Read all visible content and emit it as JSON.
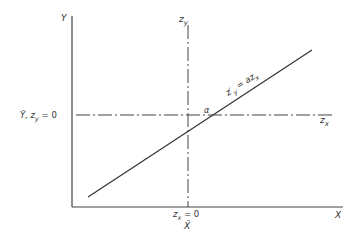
{
  "diagram": {
    "type": "standardized-coordinate-transformation",
    "colors": {
      "background": "#ffffff",
      "ink": "#333333"
    },
    "axes": {
      "y_axis_label": "Y",
      "x_axis_label": "X",
      "zy_axis_label": "z",
      "zy_axis_sub": "y",
      "zx_axis_label": "z",
      "zx_axis_sub": "x"
    },
    "annotations": {
      "y_mean_label": "Ȳ, z",
      "y_mean_sub": "y",
      "y_mean_eq": " = 0",
      "x_mean_label_z": "z",
      "x_mean_sub": "x",
      "x_mean_eq": " = 0",
      "x_bar": "X̄",
      "angle": "α",
      "regression_lhs": "z′",
      "regression_lhs_sub": "y",
      "regression_rhs": " = az",
      "regression_rhs_sub": "x"
    }
  }
}
